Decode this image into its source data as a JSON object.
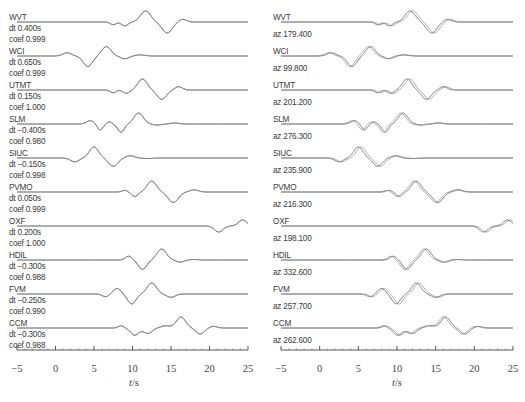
{
  "chart_data": [
    {
      "type": "line",
      "title": "Waveform fits with time shift and correlation coefficient",
      "xlabel": "t/s",
      "ylabel": "",
      "xlim": [
        -5,
        25
      ],
      "xticks": [
        -5,
        0,
        5,
        10,
        15,
        20,
        25
      ],
      "grid": false,
      "legend": null,
      "traces": [
        {
          "station": "WVT",
          "dt": "dt 0.400s",
          "coef": "coef 0.999"
        },
        {
          "station": "WCI",
          "dt": "dt 0.650s",
          "coef": "coef 0.999"
        },
        {
          "station": "UTMT",
          "dt": "dt 0.150s",
          "coef": "coef 1.000"
        },
        {
          "station": "SLM",
          "dt": "dt −0.400s",
          "coef": "coef 0.980"
        },
        {
          "station": "SIUC",
          "dt": "dt −0.150s",
          "coef": "coef 0.998"
        },
        {
          "station": "PVMO",
          "dt": "dt 0.050s",
          "coef": "coef 0.999"
        },
        {
          "station": "OXF",
          "dt": "dt 0.200s",
          "coef": "coef 1.000"
        },
        {
          "station": "HDIL",
          "dt": "dt −0.300s",
          "coef": "coef 0.988"
        },
        {
          "station": "FVM",
          "dt": "dt −0.250s",
          "coef": "coef 0.990"
        },
        {
          "station": "CCM",
          "dt": "dt −0.300s",
          "coef": "coef 0.988"
        }
      ]
    },
    {
      "type": "line",
      "title": "Waveforms with station azimuth",
      "xlabel": "t/s",
      "ylabel": "",
      "xlim": [
        -5,
        25
      ],
      "xticks": [
        -5,
        0,
        5,
        10,
        15,
        20,
        25
      ],
      "grid": false,
      "legend": null,
      "traces": [
        {
          "station": "WVT",
          "az": "az 179.400"
        },
        {
          "station": "WCI",
          "az": "az 99.800"
        },
        {
          "station": "UTMT",
          "az": "az 201.200"
        },
        {
          "station": "SLM",
          "az": "az 276.300"
        },
        {
          "station": "SIUC",
          "az": "az 235.900"
        },
        {
          "station": "PVMO",
          "az": "az 216.300"
        },
        {
          "station": "OXF",
          "az": "az 198.100"
        },
        {
          "station": "HDIL",
          "az": "az 332.600"
        },
        {
          "station": "FVM",
          "az": "az 257.700"
        },
        {
          "station": "CCM",
          "az": "az 262.600"
        }
      ]
    }
  ],
  "axis": {
    "ticks": [
      "−5",
      "0",
      "5",
      "10",
      "15",
      "20",
      "25"
    ],
    "xlabel_var": "t",
    "xlabel_unit": "/s"
  },
  "waveforms": [
    {
      "name": "WVT",
      "peaks": [
        [
          7.5,
          -0.25,
          0.6
        ],
        [
          9.0,
          -0.35,
          0.7
        ],
        [
          11.7,
          1.0,
          1.1
        ],
        [
          14.5,
          -1.0,
          1.1
        ],
        [
          16.5,
          0.25,
          0.8
        ]
      ]
    },
    {
      "name": "WCI",
      "peaks": [
        [
          1.5,
          0.3,
          0.9
        ],
        [
          4.2,
          -0.95,
          1.0
        ],
        [
          6.6,
          0.85,
          1.0
        ],
        [
          9.0,
          -0.25,
          0.9
        ],
        [
          11.0,
          0.1,
          1.0
        ]
      ]
    },
    {
      "name": "UTMT",
      "peaks": [
        [
          7.5,
          -0.25,
          0.6
        ],
        [
          9.2,
          -0.3,
          0.7
        ],
        [
          11.3,
          1.0,
          1.0
        ],
        [
          13.8,
          -0.85,
          1.0
        ],
        [
          16.0,
          0.3,
          0.8
        ]
      ]
    },
    {
      "name": "SLM",
      "peaks": [
        [
          4.5,
          0.3,
          0.8
        ],
        [
          5.8,
          -0.55,
          0.6
        ],
        [
          7.0,
          0.2,
          0.5
        ],
        [
          8.5,
          -0.75,
          0.7
        ],
        [
          10.8,
          1.0,
          1.0
        ],
        [
          13.2,
          -0.1,
          0.8
        ],
        [
          15.5,
          0.1,
          0.8
        ]
      ]
    },
    {
      "name": "SIUC",
      "peaks": [
        [
          2.5,
          -0.35,
          0.9
        ],
        [
          5.0,
          1.0,
          1.0
        ],
        [
          7.5,
          -0.75,
          1.0
        ],
        [
          9.7,
          0.2,
          0.9
        ],
        [
          12.0,
          -0.05,
          1.0
        ]
      ]
    },
    {
      "name": "PVMO",
      "peaks": [
        [
          9.0,
          0.15,
          0.6
        ],
        [
          10.3,
          -0.4,
          0.7
        ],
        [
          12.5,
          1.0,
          1.0
        ],
        [
          15.3,
          -0.95,
          1.1
        ],
        [
          18.0,
          0.2,
          0.9
        ]
      ]
    },
    {
      "name": "OXF",
      "peaks": [
        [
          21.2,
          -0.55,
          0.9
        ],
        [
          24.3,
          0.55,
          0.9
        ]
      ]
    },
    {
      "name": "HDIL",
      "peaks": [
        [
          9.5,
          0.35,
          0.7
        ],
        [
          11.3,
          -0.85,
          0.9
        ],
        [
          13.8,
          1.0,
          1.0
        ],
        [
          16.2,
          -0.2,
          0.8
        ],
        [
          18.0,
          0.05,
          0.8
        ]
      ]
    },
    {
      "name": "FVM",
      "peaks": [
        [
          6.5,
          -0.25,
          0.7
        ],
        [
          8.0,
          0.5,
          0.8
        ],
        [
          9.9,
          -0.9,
          0.9
        ],
        [
          12.5,
          1.0,
          1.0
        ],
        [
          15.0,
          -0.3,
          0.9
        ]
      ]
    },
    {
      "name": "CCM",
      "peaks": [
        [
          8.5,
          0.2,
          0.6
        ],
        [
          10.3,
          -0.65,
          0.9
        ],
        [
          12.0,
          -0.5,
          0.9
        ],
        [
          14.3,
          0.2,
          1.0
        ],
        [
          16.3,
          1.0,
          1.0
        ],
        [
          18.8,
          -0.55,
          0.9
        ],
        [
          20.5,
          0.15,
          0.8
        ]
      ]
    }
  ],
  "colors": {
    "trace": "#7a7a7a",
    "trace_alt": "#a8a8a8",
    "axis": "#555555",
    "text": "#3a3a3a"
  }
}
